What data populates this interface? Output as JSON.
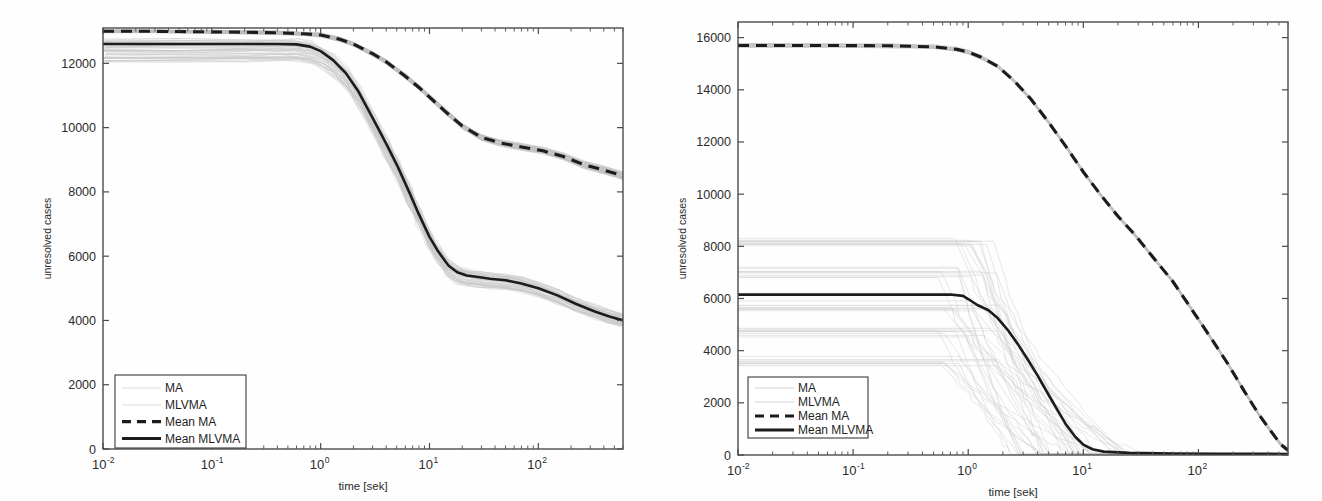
{
  "figure": {
    "background": "#fefefe",
    "ink": "#1c1c1c",
    "ensemble_color": "#c9c9c9"
  },
  "legend": {
    "entries": [
      {
        "label": "MA",
        "style": "faint-line"
      },
      {
        "label": "MLVMA",
        "style": "faint-line"
      },
      {
        "label": "Mean MA",
        "style": "dashed"
      },
      {
        "label": "Mean MLVMA",
        "style": "solid"
      }
    ]
  },
  "chart_data": [
    {
      "type": "line",
      "id": "left-panel",
      "title": "",
      "xlabel": "time [sek]",
      "ylabel": "unresolved cases",
      "xscale": "log",
      "yscale": "linear",
      "xlim": [
        0.01,
        600
      ],
      "ylim": [
        0,
        13100
      ],
      "grid": false,
      "legend_position": "lower-left",
      "xticks": [
        {
          "value": 0.01,
          "mantissa": "10",
          "exponent": "-2"
        },
        {
          "value": 0.1,
          "mantissa": "10",
          "exponent": "-1"
        },
        {
          "value": 1,
          "mantissa": "10",
          "exponent": "0"
        },
        {
          "value": 10,
          "mantissa": "10",
          "exponent": "1"
        },
        {
          "value": 100,
          "mantissa": "10",
          "exponent": "2"
        }
      ],
      "yticks": [
        0,
        2000,
        4000,
        6000,
        8000,
        10000,
        12000
      ],
      "series": [
        {
          "name": "Mean MA",
          "style": "dashed",
          "x": [
            0.01,
            0.02,
            0.05,
            0.1,
            0.2,
            0.4,
            0.7,
            1.0,
            1.5,
            2.0,
            3.0,
            4.0,
            6.0,
            8.0,
            10.0,
            14.0,
            20.0,
            30.0,
            45.0,
            70.0,
            110.0,
            170.0,
            260.0,
            400.0,
            600.0
          ],
          "y": [
            13000,
            13000,
            12990,
            12980,
            12970,
            12950,
            12920,
            12880,
            12750,
            12600,
            12300,
            12050,
            11600,
            11250,
            10950,
            10500,
            10050,
            9700,
            9520,
            9400,
            9280,
            9100,
            8850,
            8680,
            8500
          ]
        },
        {
          "name": "Mean MLVMA",
          "style": "solid",
          "x": [
            0.01,
            0.05,
            0.2,
            0.4,
            0.6,
            0.8,
            1.0,
            1.3,
            1.7,
            2.2,
            3.0,
            4.0,
            5.0,
            6.5,
            8.0,
            10.0,
            12.0,
            15.0,
            18.0,
            22.0,
            28.0,
            36.0,
            50.0,
            70.0,
            100.0,
            150.0,
            220.0,
            330.0,
            450.0,
            600.0
          ],
          "y": [
            12600,
            12600,
            12600,
            12600,
            12590,
            12520,
            12380,
            12100,
            11700,
            11150,
            10300,
            9500,
            8850,
            8000,
            7300,
            6600,
            6150,
            5700,
            5500,
            5400,
            5350,
            5300,
            5250,
            5150,
            5000,
            4780,
            4520,
            4280,
            4120,
            4000
          ]
        }
      ],
      "ensemble": {
        "note": "faint grey individual runs around both means",
        "count": 60,
        "spread_plateau": [
          11800,
          12750
        ],
        "spread_tail": [
          3700,
          4600
        ]
      }
    },
    {
      "type": "line",
      "id": "right-panel",
      "title": "",
      "xlabel": "time [sek]",
      "ylabel": "unresolved cases",
      "xscale": "log",
      "yscale": "linear",
      "xlim": [
        0.01,
        600
      ],
      "ylim": [
        0,
        16600
      ],
      "grid": false,
      "legend_position": "lower-left",
      "xticks": [
        {
          "value": 0.01,
          "mantissa": "10",
          "exponent": "-2"
        },
        {
          "value": 0.1,
          "mantissa": "10",
          "exponent": "-1"
        },
        {
          "value": 1,
          "mantissa": "10",
          "exponent": "0"
        },
        {
          "value": 10,
          "mantissa": "10",
          "exponent": "1"
        },
        {
          "value": 100,
          "mantissa": "10",
          "exponent": "2"
        }
      ],
      "yticks": [
        0,
        2000,
        4000,
        6000,
        8000,
        10000,
        12000,
        14000,
        16000
      ],
      "series": [
        {
          "name": "Mean MA",
          "style": "dashed",
          "x": [
            0.01,
            0.05,
            0.2,
            0.5,
            0.8,
            1.0,
            1.3,
            1.8,
            2.5,
            3.5,
            5.0,
            7.0,
            10.0,
            14.0,
            20.0,
            28.0,
            40.0,
            60.0,
            90.0,
            130.0,
            180.0,
            250.0,
            330.0,
            420.0,
            520.0,
            600.0
          ],
          "y": [
            15700,
            15700,
            15690,
            15650,
            15550,
            15450,
            15250,
            14900,
            14350,
            13650,
            12750,
            11850,
            10850,
            10000,
            9150,
            8450,
            7600,
            6650,
            5500,
            4450,
            3500,
            2450,
            1600,
            950,
            400,
            180
          ]
        },
        {
          "name": "Mean MLVMA",
          "style": "solid",
          "x": [
            0.01,
            0.1,
            0.4,
            0.7,
            0.9,
            1.0,
            1.2,
            1.5,
            1.8,
            2.2,
            2.7,
            3.3,
            4.0,
            5.0,
            6.0,
            7.0,
            8.5,
            10.0,
            12.0,
            15.0,
            25.0,
            60.0,
            150.0,
            400.0,
            600.0
          ],
          "y": [
            6150,
            6150,
            6150,
            6150,
            6100,
            5980,
            5750,
            5550,
            5250,
            4800,
            4250,
            3650,
            3050,
            2300,
            1700,
            1200,
            700,
            400,
            220,
            130,
            80,
            60,
            50,
            45,
            40
          ]
        }
      ],
      "ensemble": {
        "note": "faint grey step-like individual runs at distinct plateau levels",
        "count": 40,
        "plateau_levels": [
          8100,
          7000,
          5700,
          4700,
          3600
        ],
        "spread_tail": [
          0,
          200
        ]
      }
    }
  ]
}
